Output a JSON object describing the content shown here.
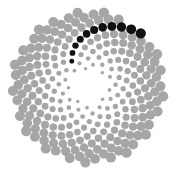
{
  "diagram": {
    "type": "phyllotaxis-spiral",
    "center": [
      88,
      87
    ],
    "dot_count": 260,
    "golden_angle_deg": 137.508,
    "scale": 4.75,
    "min_dot_radius": 0.6,
    "max_dot_radius": 5.2,
    "inner_skip": 14,
    "highlight_step": 21,
    "highlight_offset": 0,
    "highlight_angle_window_deg": [
      -75,
      15
    ],
    "colors": {
      "background": "#ffffff",
      "dot": "#a6a6a6",
      "highlight": "#111111"
    }
  }
}
